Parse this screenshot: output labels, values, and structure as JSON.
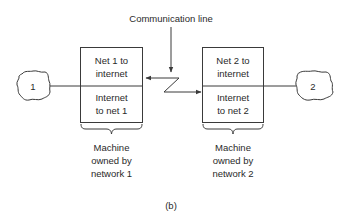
{
  "diagram": {
    "caption": "(b)",
    "communication_line_label": "Communication line",
    "networks": [
      {
        "id": "1",
        "cloud_label": "1",
        "machine": {
          "top_section": {
            "line1": "Net 1 to",
            "line2": "internet"
          },
          "bottom_section": {
            "line1": "Internet",
            "line2": "to net 1"
          },
          "owner_label": {
            "line1": "Machine",
            "line2": "owned by",
            "line3": "network 1"
          }
        }
      },
      {
        "id": "2",
        "cloud_label": "2",
        "machine": {
          "top_section": {
            "line1": "Net 2 to",
            "line2": "internet"
          },
          "bottom_section": {
            "line1": "Internet",
            "line2": "to net 2"
          },
          "owner_label": {
            "line1": "Machine",
            "line2": "owned by",
            "line3": "network 2"
          }
        }
      }
    ],
    "colors": {
      "line": "#3a3a3a",
      "text": "#2a2a2a",
      "background": "#ffffff"
    }
  }
}
